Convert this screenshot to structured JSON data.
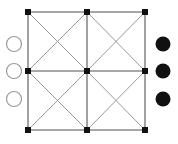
{
  "figure": {
    "canvas": {
      "width": 178,
      "height": 144,
      "background": "#ffffff"
    }
  },
  "style": {
    "grid_line_color": "#8a8a8a",
    "diagonal_line_color": "#9a9a9a",
    "grid_line_width": 1.6,
    "diagonal_line_width": 1.0,
    "node_fill": "#111111",
    "node_size": 6,
    "filled_circle_fill": "#111111",
    "hollow_circle_fill": "#ffffff",
    "hollow_circle_stroke": "#9a9a9a",
    "circle_radius": 7.5,
    "circle_stroke_width": 1.2
  },
  "chart_data": {
    "type": "diagram",
    "grid_nodes": [
      {
        "id": "n00",
        "label": "top-left",
        "x": 28,
        "y": 12,
        "shape": "square",
        "fill": "black"
      },
      {
        "id": "n10",
        "label": "top-center",
        "x": 87,
        "y": 12,
        "shape": "square",
        "fill": "black"
      },
      {
        "id": "n20",
        "label": "top-right",
        "x": 145,
        "y": 12,
        "shape": "square",
        "fill": "black"
      },
      {
        "id": "n01",
        "label": "middle-left",
        "x": 28,
        "y": 71,
        "shape": "square",
        "fill": "black"
      },
      {
        "id": "n11",
        "label": "center",
        "x": 87,
        "y": 71,
        "shape": "square",
        "fill": "black"
      },
      {
        "id": "n21",
        "label": "middle-right",
        "x": 145,
        "y": 71,
        "shape": "square",
        "fill": "black"
      },
      {
        "id": "n02",
        "label": "bottom-left",
        "x": 28,
        "y": 130,
        "shape": "square",
        "fill": "black"
      },
      {
        "id": "n12",
        "label": "bottom-center",
        "x": 87,
        "y": 130,
        "shape": "square",
        "fill": "black"
      },
      {
        "id": "n22",
        "label": "bottom-right",
        "x": 145,
        "y": 130,
        "shape": "square",
        "fill": "black"
      }
    ],
    "grid_edges": [
      {
        "from": "n00",
        "to": "n10",
        "kind": "orthogonal"
      },
      {
        "from": "n10",
        "to": "n20",
        "kind": "orthogonal"
      },
      {
        "from": "n01",
        "to": "n11",
        "kind": "orthogonal"
      },
      {
        "from": "n11",
        "to": "n21",
        "kind": "orthogonal"
      },
      {
        "from": "n02",
        "to": "n12",
        "kind": "orthogonal"
      },
      {
        "from": "n12",
        "to": "n22",
        "kind": "orthogonal"
      },
      {
        "from": "n00",
        "to": "n01",
        "kind": "orthogonal"
      },
      {
        "from": "n01",
        "to": "n02",
        "kind": "orthogonal"
      },
      {
        "from": "n10",
        "to": "n11",
        "kind": "orthogonal"
      },
      {
        "from": "n11",
        "to": "n12",
        "kind": "orthogonal"
      },
      {
        "from": "n20",
        "to": "n21",
        "kind": "orthogonal"
      },
      {
        "from": "n21",
        "to": "n22",
        "kind": "orthogonal"
      }
    ],
    "diagonal_edges": [
      {
        "from": "n00",
        "to": "n11",
        "kind": "diagonal",
        "cell": "top-left"
      },
      {
        "from": "n10",
        "to": "n01",
        "kind": "diagonal",
        "cell": "top-left"
      },
      {
        "from": "n10",
        "to": "n21",
        "kind": "diagonal",
        "cell": "top-right"
      },
      {
        "from": "n20",
        "to": "n11",
        "kind": "diagonal",
        "cell": "top-right"
      },
      {
        "from": "n01",
        "to": "n12",
        "kind": "diagonal",
        "cell": "bottom-left"
      },
      {
        "from": "n11",
        "to": "n02",
        "kind": "diagonal",
        "cell": "bottom-left"
      },
      {
        "from": "n11",
        "to": "n22",
        "kind": "diagonal",
        "cell": "bottom-right"
      },
      {
        "from": "n21",
        "to": "n12",
        "kind": "diagonal",
        "cell": "bottom-right"
      }
    ],
    "left_circles": [
      {
        "id": "lc1",
        "label": "hollow-circle-top",
        "x": 14,
        "y": 44,
        "fill": "white",
        "radius": 7.5
      },
      {
        "id": "lc2",
        "label": "hollow-circle-middle",
        "x": 14,
        "y": 71,
        "fill": "white",
        "radius": 7.5
      },
      {
        "id": "lc3",
        "label": "hollow-circle-bottom",
        "x": 14,
        "y": 99,
        "fill": "white",
        "radius": 7.5
      }
    ],
    "right_circles": [
      {
        "id": "rc1",
        "label": "filled-circle-top",
        "x": 163,
        "y": 44,
        "fill": "black",
        "radius": 7.5
      },
      {
        "id": "rc2",
        "label": "filled-circle-middle",
        "x": 163,
        "y": 71,
        "fill": "black",
        "radius": 7.5
      },
      {
        "id": "rc3",
        "label": "filled-circle-bottom",
        "x": 163,
        "y": 99,
        "fill": "black",
        "radius": 7.5
      }
    ],
    "counts": {
      "grid_nodes": 9,
      "orthogonal_edges": 12,
      "diagonal_edges": 8,
      "hollow_circles": 3,
      "filled_circles": 3
    }
  }
}
